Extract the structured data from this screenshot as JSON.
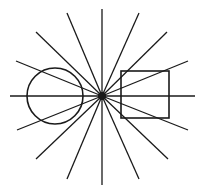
{
  "diagram": {
    "title": "",
    "background": "#ffffff",
    "stroke_color": "#1a1a1a",
    "center": {
      "x": 102,
      "y": 96
    },
    "center_dot_radius": 4,
    "rays": [
      {
        "x2": 102,
        "y2": 9
      },
      {
        "x2": 67,
        "y2": 13
      },
      {
        "x2": 139,
        "y2": 13
      },
      {
        "x2": 36,
        "y2": 32
      },
      {
        "x2": 167,
        "y2": 32
      },
      {
        "x2": 16,
        "y2": 61
      },
      {
        "x2": 188,
        "y2": 61
      },
      {
        "x2": 10,
        "y2": 96
      },
      {
        "x2": 195,
        "y2": 96
      },
      {
        "x2": 17,
        "y2": 130
      },
      {
        "x2": 188,
        "y2": 130
      },
      {
        "x2": 36,
        "y2": 159
      },
      {
        "x2": 168,
        "y2": 159
      },
      {
        "x2": 67,
        "y2": 179
      },
      {
        "x2": 139,
        "y2": 179
      },
      {
        "x2": 102,
        "y2": 185
      }
    ],
    "circle": {
      "cx": 55,
      "cy": 96,
      "r": 28
    },
    "square": {
      "x": 121,
      "y": 71,
      "width": 48,
      "height": 47
    }
  }
}
